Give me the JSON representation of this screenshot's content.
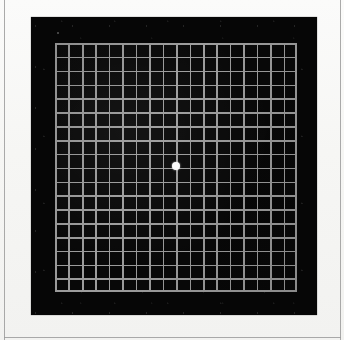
{
  "document": {
    "type": "amsler-grid-test-chart",
    "title": "Amsler Grid",
    "description": "Black Amsler grid chart with white central fixation dot",
    "orientation": "square"
  },
  "page": {
    "width_px": 344,
    "height_px": 340,
    "paper_color": "#f8f8f6",
    "margin_rule_color": "#9b9b9b"
  },
  "frame": {
    "name": "black-surround",
    "color": "#060606",
    "left_px": 31,
    "top_px": 17,
    "width_px": 286,
    "height_px": 298
  },
  "grid": {
    "name": "amsler-grid",
    "background_color": "#080808",
    "line_color": "#9d9d9d",
    "line_width_px": 1.6,
    "columns": 18,
    "rows": 18,
    "cell_width_px": 13.45,
    "cell_height_px": 13.85,
    "left_px": 55,
    "top_px": 43,
    "width_px": 242,
    "height_px": 249
  },
  "fixation_dot": {
    "name": "central-fixation-dot",
    "color": "#ffffff",
    "diameter_px": 8,
    "center_x_px": 176,
    "center_y_px": 166
  },
  "chart_data": {
    "type": "heatmap",
    "xlabel": "",
    "ylabel": "",
    "categories": [],
    "values": [],
    "grid": true,
    "legend": "none",
    "columns": 18,
    "rows": 18,
    "line_color": "#9d9d9d",
    "background_color": "#080808",
    "marker": {
      "label": "central fixation dot",
      "x": 9,
      "y": 9,
      "color": "#ffffff"
    }
  }
}
